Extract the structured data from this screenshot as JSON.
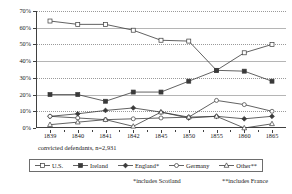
{
  "chart_data": {
    "type": "line",
    "title": "",
    "subtitle": "",
    "xlabel": "",
    "ylabel": "",
    "caption": "convicted defendants, n=2,931",
    "categories": [
      "1839",
      "1840",
      "1841",
      "1842",
      "1845",
      "1850",
      "1855",
      "1860",
      "1865"
    ],
    "ylim": [
      0,
      70
    ],
    "yticks": [
      0,
      10,
      20,
      30,
      40,
      50,
      60,
      70
    ],
    "ytick_labels": [
      "0%",
      "10%",
      "20%",
      "30%",
      "40%",
      "50%",
      "60%",
      "70%"
    ],
    "grid": true,
    "legend_position": "bottom",
    "series": [
      {
        "name": "U.S.",
        "marker": "open-square",
        "values": [
          64,
          62,
          62,
          58.5,
          52.5,
          52,
          34.5,
          45,
          50
        ]
      },
      {
        "name": "Ireland",
        "marker": "filled-square",
        "values": [
          20,
          20,
          16,
          21.5,
          21.5,
          28,
          34.5,
          34,
          28
        ]
      },
      {
        "name": "England*",
        "marker": "filled-diamond",
        "values": [
          7,
          8.5,
          10.5,
          12,
          9.5,
          6,
          7,
          5.5,
          7
        ]
      },
      {
        "name": "Germany",
        "marker": "open-circle",
        "values": [
          7,
          6,
          5,
          5.5,
          6,
          6.5,
          16.5,
          14,
          10
        ]
      },
      {
        "name": "Other**",
        "marker": "open-triangle",
        "values": [
          2,
          3.5,
          5,
          1,
          9.5,
          6.5,
          7,
          0,
          2.5
        ]
      }
    ],
    "annotations": [
      "*includes Scotland",
      "**includes France"
    ],
    "colors": {
      "line": "#3a3a3a",
      "axis": "#404040",
      "grid": "#9a9a9a",
      "background": "#ffffff"
    }
  },
  "footnotes": {
    "scotland": "*includes Scotland",
    "france": "**includes France"
  }
}
